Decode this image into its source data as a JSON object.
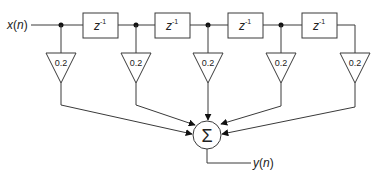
{
  "diagram": {
    "title": "",
    "input_label": "x(n)",
    "input_var": "x",
    "input_arg": "n",
    "output_label": "y(n)",
    "output_var": "y",
    "output_arg": "n",
    "delay_label": "z",
    "delay_exponent": "-1",
    "delays": [
      {
        "label": "z",
        "exponent": "-1"
      },
      {
        "label": "z",
        "exponent": "-1"
      },
      {
        "label": "z",
        "exponent": "-1"
      },
      {
        "label": "z",
        "exponent": "-1"
      }
    ],
    "gains": [
      "0.2",
      "0.2",
      "0.2",
      "0.2",
      "0.2"
    ],
    "summer_symbol": "Σ",
    "colors": {
      "line": "#3a3a3a",
      "text": "#222222",
      "node": "#111111",
      "background": "#ffffff"
    }
  }
}
